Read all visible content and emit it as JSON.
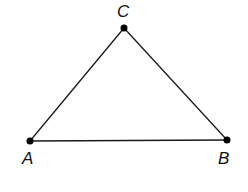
{
  "diagram": {
    "type": "triangle",
    "vertices": [
      {
        "name": "A",
        "x": 30,
        "y": 141,
        "label_x": 22,
        "label_y": 164
      },
      {
        "name": "B",
        "x": 227,
        "y": 140,
        "label_x": 218,
        "label_y": 164
      },
      {
        "name": "C",
        "x": 124,
        "y": 28,
        "label_x": 117,
        "label_y": 17
      }
    ],
    "edges": [
      [
        "A",
        "B"
      ],
      [
        "B",
        "C"
      ],
      [
        "C",
        "A"
      ]
    ],
    "colors": {
      "stroke": "#1a1a1a",
      "point": "#000000",
      "background": "#ffffff"
    }
  }
}
